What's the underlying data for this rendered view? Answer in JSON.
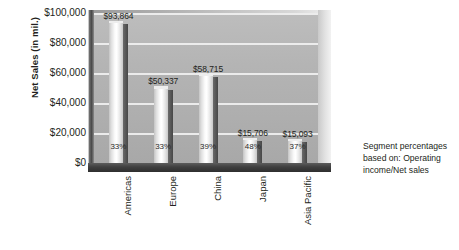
{
  "chart_data": {
    "type": "bar",
    "title": "",
    "xlabel": "",
    "ylabel": "Net Sales (in mil.)",
    "categories": [
      "Americas",
      "Europe",
      "China",
      "Japan",
      "Asia Pacific"
    ],
    "values": [
      93864,
      50337,
      58715,
      15706,
      15093
    ],
    "value_labels": [
      "$93,864",
      "$50,337",
      "$58,715",
      "$15,706",
      "$15,093"
    ],
    "percent_labels": [
      "33%",
      "33%",
      "39%",
      "48%",
      "37%"
    ],
    "percent_values": [
      33,
      33,
      39,
      48,
      37
    ],
    "ylim": [
      0,
      100000
    ],
    "yticks": [
      0,
      20000,
      40000,
      60000,
      80000,
      100000
    ],
    "ytick_labels": [
      "$0",
      "$20,000",
      "$40,000",
      "$60,000",
      "$80,000",
      "$100,000"
    ],
    "grid": true,
    "legend": "none",
    "series": [
      {
        "name": "Net Sales",
        "values": [
          93864,
          50337,
          58715,
          15706,
          15093
        ]
      }
    ]
  },
  "caption": {
    "line1": "Segment percentages",
    "line2": "based on: Operating",
    "line3": "income/Net sales"
  },
  "colors": {
    "plot_background": "#b0b0b0",
    "gridline": "#f0f0f0",
    "bar_face": "#ffffff",
    "bar_side": "#4f4f4f",
    "text": "#231f20",
    "page_background": "#ffffff"
  }
}
